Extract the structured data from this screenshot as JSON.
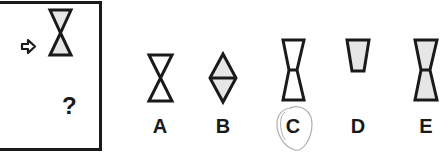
{
  "question": {
    "mark": "?",
    "arrow_icon": "right-arrow-icon",
    "given_shape": "hourglass-x-shaded-top-and-bottom"
  },
  "options": [
    {
      "label": "A",
      "shape": "hourglass-x-unshaded",
      "x": 160
    },
    {
      "label": "B",
      "shape": "diamond-shaded",
      "x": 223
    },
    {
      "label": "C",
      "shape": "truncated-hourglass-unshaded",
      "x": 293,
      "circled": true
    },
    {
      "label": "D",
      "shape": "trapezoid-shaded",
      "x": 358
    },
    {
      "label": "E",
      "shape": "truncated-hourglass-shaded",
      "x": 426
    }
  ],
  "colors": {
    "stroke": "#1a1a1a",
    "fill": "#e6e6e6",
    "circle": "#b0b0b0"
  }
}
